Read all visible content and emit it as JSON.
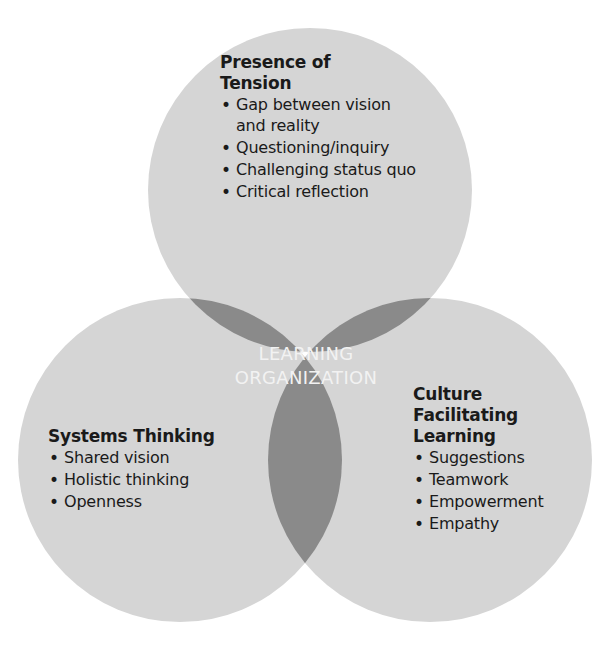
{
  "diagram": {
    "type": "venn",
    "colors": {
      "single": "#d5d5d5",
      "double": "#8a8a8a",
      "triple": "#2d2d2d",
      "text_dark": "#1a1a1a",
      "text_light": "#f2f2f2"
    },
    "center": {
      "line1": "LEARNING",
      "line2": "ORGANIZATION"
    },
    "circles": [
      {
        "id": "top",
        "title_line1": "Presence of",
        "title_line2": "Tension",
        "items": [
          "Gap between vision",
          "and reality",
          "Questioning/inquiry",
          "Challenging status quo",
          "Critical reflection"
        ]
      },
      {
        "id": "left",
        "title_line1": "Systems Thinking",
        "items": [
          "Shared vision",
          "Holistic thinking",
          "Openness"
        ]
      },
      {
        "id": "right",
        "title_line1": "Culture",
        "title_line2": "Facilitating",
        "title_line3": "Learning",
        "items": [
          "Suggestions",
          "Teamwork",
          "Empowerment",
          "Empathy"
        ]
      }
    ]
  }
}
